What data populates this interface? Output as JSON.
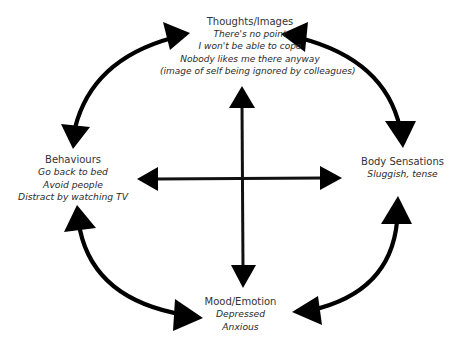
{
  "diagram": {
    "type": "cognitive-behavioural five-areas model",
    "nodes": {
      "thoughts": {
        "title": "Thoughts/Images",
        "lines": [
          "There's no point",
          "I won't be able to cope",
          "Nobody likes me there anyway",
          "(image of self being ignored by colleagues)"
        ]
      },
      "behaviours": {
        "title": "Behaviours",
        "lines": [
          "Go back to bed",
          "Avoid people",
          "Distract by watching TV"
        ]
      },
      "body": {
        "title": "Body Sensations",
        "lines": [
          "Sluggish, tense"
        ]
      },
      "mood": {
        "title": "Mood/Emotion",
        "lines": [
          "Depressed",
          "Anxious"
        ]
      }
    },
    "connections": [
      {
        "from": "thoughts",
        "to": "behaviours",
        "style": "curved double-headed arrow"
      },
      {
        "from": "thoughts",
        "to": "body",
        "style": "curved double-headed arrow"
      },
      {
        "from": "behaviours",
        "to": "mood",
        "style": "curved double-headed arrow"
      },
      {
        "from": "body",
        "to": "mood",
        "style": "curved double-headed arrow"
      },
      {
        "from": "thoughts",
        "to": "mood",
        "style": "straight double-headed arrow (vertical)"
      },
      {
        "from": "behaviours",
        "to": "body",
        "style": "straight double-headed arrow (horizontal)"
      }
    ],
    "colors": {
      "arrow": "#000000",
      "text": "#2a2a2a",
      "background": "#ffffff"
    }
  }
}
